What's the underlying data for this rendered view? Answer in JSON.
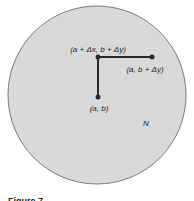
{
  "diagram": {
    "region": {
      "label": "N",
      "fill": "#d9d9d9",
      "stroke": "#7a7a7a"
    },
    "points": [
      {
        "id": "p0",
        "label": "(a, b)"
      },
      {
        "id": "p1",
        "label": "(a, b + Δy)"
      },
      {
        "id": "p2",
        "label": "(a + Δx, b + Δy)"
      }
    ],
    "path_color": "#2a2a2a",
    "caption": "Figure 7"
  }
}
